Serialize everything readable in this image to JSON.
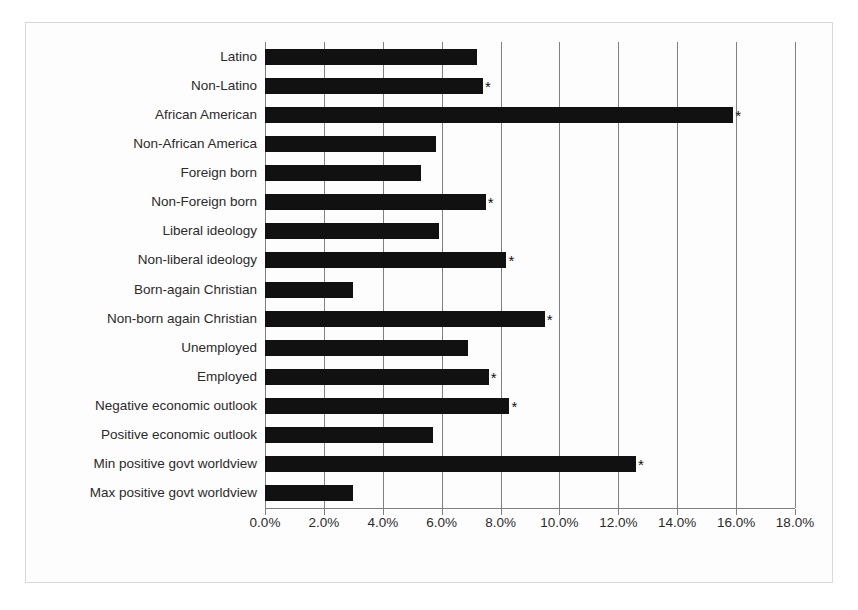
{
  "chart_data": {
    "type": "bar",
    "orientation": "horizontal",
    "title": "",
    "subtitle": "",
    "xlabel": "",
    "ylabel": "",
    "xlim": [
      0,
      18
    ],
    "ylim": null,
    "grid": true,
    "legend": null,
    "value_suffix": "%",
    "xticks": [
      0,
      2,
      4,
      6,
      8,
      10,
      12,
      14,
      16,
      18
    ],
    "xticklabels": [
      "0.0%",
      "2.0%",
      "4.0%",
      "6.0%",
      "8.0%",
      "10.0%",
      "12.0%",
      "14.0%",
      "16.0%",
      "18.0%"
    ],
    "categories": [
      "Latino",
      "Non-Latino",
      "African American",
      "Non-African America",
      "Foreign born",
      "Non-Foreign born",
      "Liberal ideology",
      "Non-liberal ideology",
      "Born-again Christian",
      "Non-born again Christian",
      "Unemployed",
      "Employed",
      "Negative economic outlook",
      "Positive economic outlook",
      "Min positive govt worldview",
      "Max positive govt worldview"
    ],
    "values": [
      7.2,
      7.4,
      15.9,
      5.8,
      5.3,
      7.5,
      5.9,
      8.2,
      3.0,
      9.5,
      6.9,
      7.6,
      8.3,
      5.7,
      12.6,
      3.0
    ],
    "annotations": [
      "",
      "*",
      "*",
      "",
      "",
      "*",
      "",
      "*",
      "",
      "*",
      "",
      "*",
      "*",
      "",
      "*",
      ""
    ],
    "bar_color": "#111111",
    "grid_color": "#808080",
    "annotation_marker": "*",
    "annotation_note": "Asterisk marks statistically significant difference"
  }
}
